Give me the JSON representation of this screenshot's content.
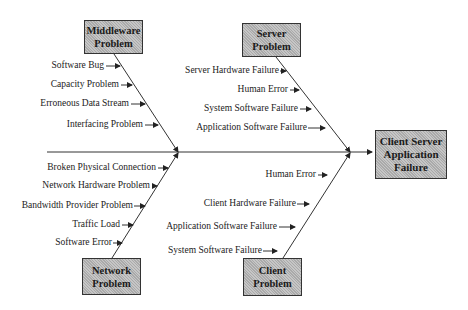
{
  "diagram": {
    "type": "fishbone",
    "effect": {
      "line1": "Client Server",
      "line2": "Application",
      "line3": "Failure"
    },
    "categories": {
      "middleware": {
        "line1": "Middleware",
        "line2": "Problem",
        "causes": [
          "Software Bug",
          "Capacity Problem",
          "Erroneous Data Stream",
          "Interfacing Problem"
        ]
      },
      "server": {
        "line1": "Server",
        "line2": "Problem",
        "causes": [
          "Server Hardware Failure",
          "Human Error",
          "System Software Failure",
          "Application Software Failure"
        ]
      },
      "network": {
        "line1": "Network",
        "line2": "Problem",
        "causes": [
          "Broken Physical Connection",
          "Network Hardware Problem",
          "Bandwidth Provider Problem",
          "Traffic Load",
          "Software Error"
        ]
      },
      "client": {
        "line1": "Client",
        "line2": "Problem",
        "causes": [
          "Human Error",
          "Client Hardware Failure",
          "Application Software Failure",
          "System Software Failure"
        ]
      }
    },
    "colors": {
      "box_fill": "#b8b8b8",
      "line": "#333333"
    }
  }
}
